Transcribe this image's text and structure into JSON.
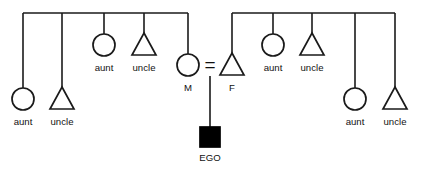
{
  "diagram": {
    "type": "kinship-genealogy-chart",
    "stroke_color": "#1a1a1a",
    "fill_color": "#ffffff",
    "ego_fill_color": "#000000",
    "background_color": "#ffffff",
    "canvas": {
      "width": 421,
      "height": 173
    },
    "marriage_symbol": "=",
    "legend": {
      "circle_means": "female",
      "triangle_means": "male",
      "filled_square_means": "ego"
    }
  },
  "sibship_bars": [
    {
      "name": "maternal-sibship-bar",
      "side": "maternal",
      "x1": 23,
      "x2": 188,
      "y": 13
    },
    {
      "name": "paternal-sibship-bar",
      "side": "paternal",
      "x1": 232,
      "x2": 395,
      "y": 13
    }
  ],
  "persons": [
    {
      "id": "m-aunt-1",
      "label": "aunt",
      "shape": "circle",
      "sex": "female",
      "side": "maternal",
      "cx": 23,
      "cy": 99,
      "r": 11,
      "drop_from_y": 13,
      "label_x": 23,
      "label_y": 125
    },
    {
      "id": "m-uncle-1",
      "label": "uncle",
      "shape": "triangle",
      "sex": "male",
      "side": "maternal",
      "cx": 62,
      "cy": 99,
      "r": 12,
      "drop_from_y": 13,
      "label_x": 62,
      "label_y": 125
    },
    {
      "id": "m-aunt-2",
      "label": "aunt",
      "shape": "circle",
      "sex": "female",
      "side": "maternal",
      "cx": 104,
      "cy": 45,
      "r": 11,
      "drop_from_y": 13,
      "label_x": 104,
      "label_y": 71
    },
    {
      "id": "m-uncle-2",
      "label": "uncle",
      "shape": "triangle",
      "sex": "male",
      "side": "maternal",
      "cx": 144,
      "cy": 45,
      "r": 12,
      "drop_from_y": 13,
      "label_x": 144,
      "label_y": 71
    },
    {
      "id": "mother",
      "label": "M",
      "shape": "circle",
      "sex": "female",
      "side": "maternal",
      "cx": 188,
      "cy": 65,
      "r": 11,
      "drop_from_y": 13,
      "label_x": 188,
      "label_y": 91
    },
    {
      "id": "father",
      "label": "F",
      "shape": "triangle",
      "sex": "male",
      "side": "paternal",
      "cx": 232,
      "cy": 65,
      "r": 12,
      "drop_from_y": 13,
      "label_x": 232,
      "label_y": 91
    },
    {
      "id": "p-aunt-1",
      "label": "aunt",
      "shape": "circle",
      "sex": "female",
      "side": "paternal",
      "cx": 273,
      "cy": 45,
      "r": 11,
      "drop_from_y": 13,
      "label_x": 273,
      "label_y": 71
    },
    {
      "id": "p-uncle-1",
      "label": "uncle",
      "shape": "triangle",
      "sex": "male",
      "side": "paternal",
      "cx": 312,
      "cy": 45,
      "r": 12,
      "drop_from_y": 13,
      "label_x": 312,
      "label_y": 71
    },
    {
      "id": "p-aunt-2",
      "label": "aunt",
      "shape": "circle",
      "sex": "female",
      "side": "paternal",
      "cx": 355,
      "cy": 99,
      "r": 11,
      "drop_from_y": 13,
      "label_x": 355,
      "label_y": 125
    },
    {
      "id": "p-uncle-2",
      "label": "uncle",
      "shape": "triangle",
      "sex": "male",
      "side": "paternal",
      "cx": 395,
      "cy": 99,
      "r": 12,
      "drop_from_y": 13,
      "label_x": 395,
      "label_y": 125
    }
  ],
  "ego": {
    "id": "ego",
    "label": "EGO",
    "shape": "square-filled",
    "x": 200,
    "y": 127,
    "size": 20,
    "label_x": 210,
    "label_y": 161
  },
  "marriage": {
    "name": "parents-marriage",
    "symbol": "=",
    "symbol_x": 210,
    "symbol_y": 71,
    "descent_line_x": 210,
    "descent_line_y1": 76,
    "descent_line_y2": 127
  },
  "labels": {
    "mother": "M",
    "father": "F",
    "ego": "EGO",
    "aunt": "aunt",
    "uncle": "uncle"
  }
}
